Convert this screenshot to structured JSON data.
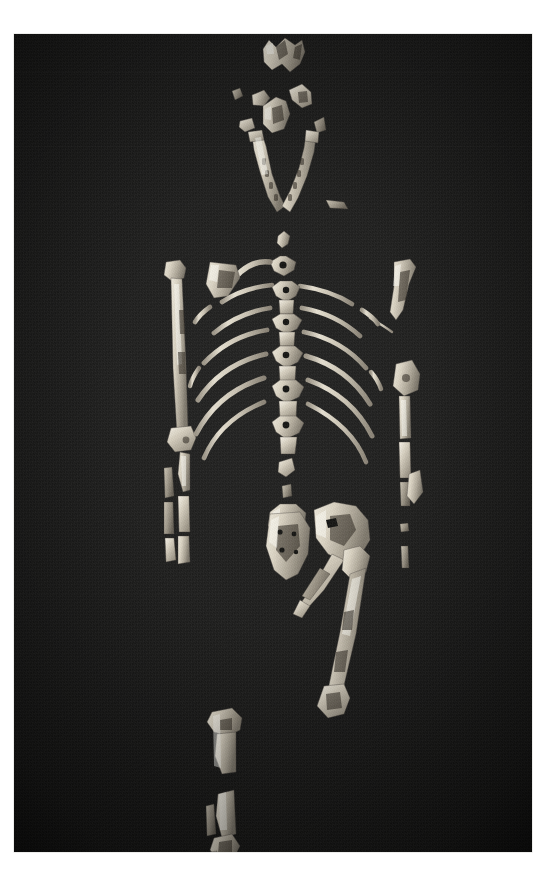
{
  "document": {
    "type": "photographic-plate",
    "subject": "Fossil hominid partial skeleton laid out in anatomical position",
    "orientation": "portrait",
    "background_color": "#1a1a19",
    "bone_color": "#d8d2c4",
    "page_color": "#ffffff",
    "photo_border_color": "#d8d8d4"
  },
  "photo": {
    "left": 14,
    "top": 34,
    "width": 518,
    "height": 818
  },
  "specimen": {
    "regions": [
      {
        "name": "cranium",
        "label": "Cranial vault fragments",
        "element_count": 1,
        "position": "top-center"
      },
      {
        "name": "facial-and-skull-fragments",
        "label": "Frontal, temporal and maxillary fragments",
        "element_count": 6,
        "position": "upper-center"
      },
      {
        "name": "mandible",
        "label": "Mandible with dental arcade",
        "element_count": 1,
        "position": "upper-center"
      },
      {
        "name": "cervical-vertebrae",
        "label": "Cervical vertebrae",
        "element_count": 2,
        "position": "neck"
      },
      {
        "name": "clavicle",
        "label": "Clavicle",
        "element_count": 1,
        "position": "shoulder-left"
      },
      {
        "name": "scapula",
        "label": "Scapula fragment",
        "element_count": 1,
        "position": "shoulder-left"
      },
      {
        "name": "ribs",
        "label": "Rib fragments",
        "element_count": 14,
        "position": "thorax"
      },
      {
        "name": "thoracic-vertebrae",
        "label": "Thoracic vertebrae",
        "element_count": 5,
        "position": "spine"
      },
      {
        "name": "lumbar-vertebrae",
        "label": "Lumbar vertebrae",
        "element_count": 3,
        "position": "lower-spine"
      },
      {
        "name": "left-humerus",
        "label": "Left humerus",
        "element_count": 1,
        "position": "arm-left"
      },
      {
        "name": "left-radius-ulna",
        "label": "Left radius and ulna",
        "element_count": 2,
        "position": "forearm-left"
      },
      {
        "name": "right-humerus",
        "label": "Right humerus (proximal)",
        "element_count": 1,
        "position": "arm-right"
      },
      {
        "name": "right-radius-ulna",
        "label": "Right radius and ulna",
        "element_count": 2,
        "position": "forearm-right"
      },
      {
        "name": "sacrum",
        "label": "Sacrum",
        "element_count": 1,
        "position": "pelvis"
      },
      {
        "name": "innominate",
        "label": "Innominate (hip bone)",
        "element_count": 1,
        "position": "pelvis"
      },
      {
        "name": "femur",
        "label": "Left femur",
        "element_count": 1,
        "position": "thigh"
      },
      {
        "name": "tibia-proximal",
        "label": "Proximal tibia",
        "element_count": 1,
        "position": "lower-leg"
      },
      {
        "name": "tibia-fibula-distal",
        "label": "Distal tibia and fibula with ankle",
        "element_count": 2,
        "position": "ankle"
      },
      {
        "name": "foot-fragments",
        "label": "Foot phalanx fragments",
        "element_count": 2,
        "position": "foot"
      }
    ]
  }
}
